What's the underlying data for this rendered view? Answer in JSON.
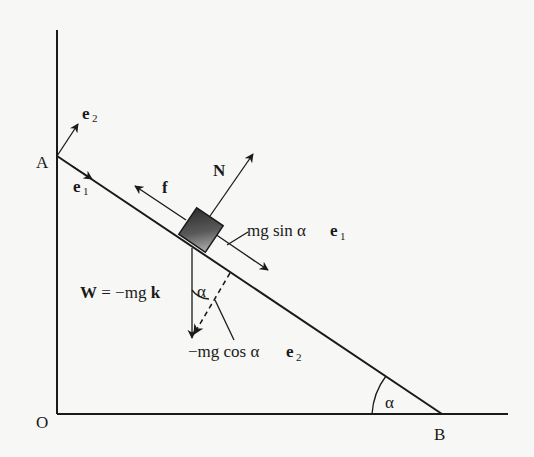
{
  "diagram": {
    "points": {
      "A": "A",
      "O": "O",
      "B": "B"
    },
    "unit_vectors": {
      "e1": {
        "base": "e",
        "sub": "1"
      },
      "e2": {
        "base": "e",
        "sub": "2"
      }
    },
    "forces": {
      "normal": "N",
      "friction": "f",
      "weight": "W = −mg k",
      "weight_parts": {
        "W": "W",
        "eq": " = −mg ",
        "k": "k"
      },
      "parallel_component": {
        "text": "mg sin α ",
        "vec": "e",
        "sub": "1"
      },
      "perpendicular_component": {
        "text": "−mg cos α ",
        "vec": "e",
        "sub": "2"
      }
    },
    "angles": {
      "incline_angle": "α",
      "weight_angle": "α"
    },
    "colors": {
      "ink": "#1a1a1a",
      "paper": "#f7f7f5",
      "block_dark": "#3a3a3a",
      "block_light": "#9a9a9a"
    }
  }
}
